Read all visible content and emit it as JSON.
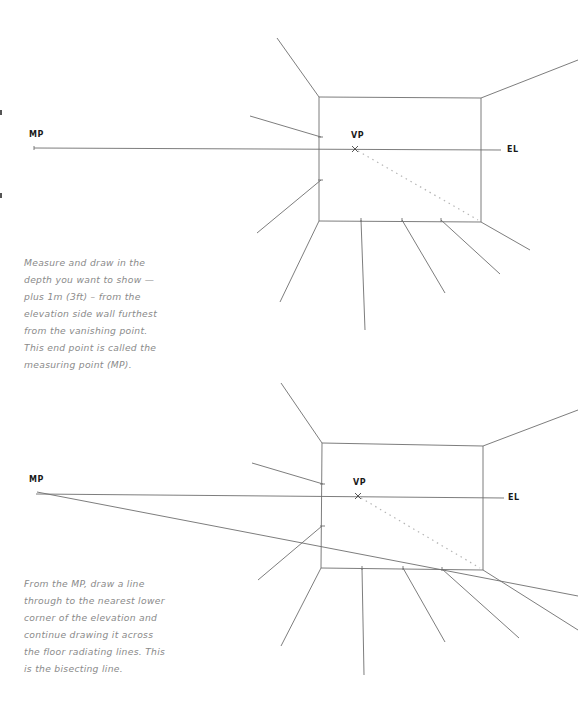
{
  "colors": {
    "line": "#6e6e6e",
    "dotted": "#b5b5b5",
    "label": "#1a1a1a",
    "caption": "#8a8a8a",
    "background": "#ffffff"
  },
  "diagrams": [
    {
      "id": "step-measuring-point",
      "labels": {
        "mp": "MP",
        "vp": "VP",
        "el": "EL"
      },
      "caption": "Measure and draw in the depth you want to show — plus 1m (3ft) – from the elevation side wall furthest from the vanishing point. This end point is called the measuring point (MP).",
      "caption_lines": [
        "Measure and draw in the",
        "depth you want to show —",
        "plus 1m (3ft) – from the",
        "elevation side wall furthest",
        "from the vanishing point.",
        "This end point is called the",
        "measuring point (MP)."
      ]
    },
    {
      "id": "step-bisecting-line",
      "labels": {
        "mp": "MP",
        "vp": "VP",
        "el": "EL"
      },
      "caption": "From the MP, draw a line through to the nearest lower corner of the elevation and continue drawing it across the floor radiating lines. This is the bisecting line.",
      "caption_lines": [
        "From the MP, draw a line",
        "through to the nearest lower",
        "corner of the elevation and",
        "continue drawing it across",
        "the floor radiating lines. This",
        "is the bisecting line."
      ]
    }
  ]
}
